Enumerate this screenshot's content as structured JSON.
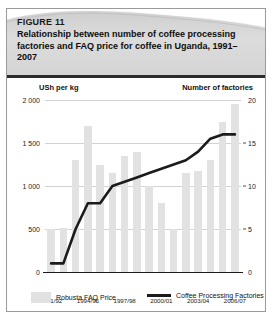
{
  "figure": {
    "number": "FIGURE 11",
    "title": "Relationship between number of coffee processing factories and FAQ price for coffee in Uganda, 1991–2007"
  },
  "axis_captions": {
    "left": "USh per kg",
    "right": "Number of factories"
  },
  "legend": {
    "bars_label": "Robusta FAQ Price",
    "line_label": "Coffee Processing Factories"
  },
  "colors": {
    "bar_fill": "#e2e2e2",
    "line_stroke": "#1b1b1b",
    "grid": "#d2d2d2",
    "axis": "#1b1b1b",
    "header_band": "#d8d8d8",
    "card_border": "#9a9a9a"
  },
  "chart_data": {
    "type": "bar",
    "title": "Relationship between number of coffee processing factories and FAQ price for coffee in Uganda, 1991–2007",
    "xlabel": "",
    "ylabel": "USh per kg",
    "y2label": "Number of factories",
    "ylim": [
      0,
      2000
    ],
    "y2lim": [
      0,
      20
    ],
    "yticks": [
      0,
      500,
      1000,
      1500,
      2000
    ],
    "ytick_labels": [
      "0",
      "500",
      "1 000",
      "1 500",
      "2 000"
    ],
    "y2ticks": [
      0,
      5,
      10,
      15,
      20
    ],
    "y2tick_labels": [
      "0",
      "5",
      "10",
      "15",
      "20"
    ],
    "grid": true,
    "legend_position": "bottom",
    "categories": [
      "1991/92",
      "1992/93",
      "1993/94",
      "1994/95",
      "1995/96",
      "1996/97",
      "1997/98",
      "1998/99",
      "1999/00",
      "2000/01",
      "2001/02",
      "2002/03",
      "2003/04",
      "2004/05",
      "2005/06",
      "2006/07"
    ],
    "xtick_labels": [
      "1991/92",
      "1994/95",
      "1997/98",
      "2000/01",
      "2003/04",
      "2006/07"
    ],
    "xtick_indices": [
      0,
      3,
      6,
      9,
      12,
      15
    ],
    "series": [
      {
        "name": "Robusta FAQ Price",
        "type": "bar",
        "axis": "left",
        "unit": "USh per kg",
        "values": [
          500,
          510,
          1300,
          1700,
          1250,
          1150,
          1350,
          1400,
          1000,
          800,
          500,
          1150,
          1170,
          1300,
          1750,
          1950
        ]
      },
      {
        "name": "Coffee Processing Factories",
        "type": "line",
        "axis": "right",
        "unit": "factories",
        "values": [
          1,
          1,
          5,
          8,
          8,
          10,
          10.5,
          11,
          11.5,
          12,
          12.5,
          13,
          14,
          15.5,
          16,
          16
        ]
      }
    ]
  }
}
